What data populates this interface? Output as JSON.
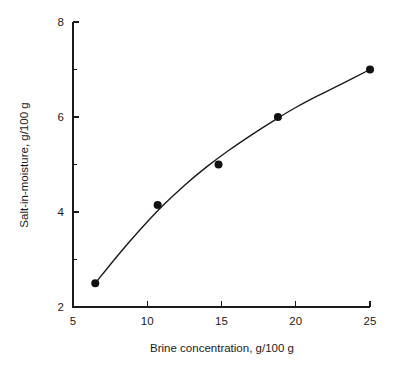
{
  "chart_data": {
    "type": "scatter",
    "title": "",
    "subtitle": "",
    "xlabel": "Brine concentration, g/100 g",
    "ylabel": "Salt-in-moisture, g/100 g",
    "xlim": [
      5,
      25
    ],
    "ylim": [
      2,
      8
    ],
    "xticks": [
      5,
      10,
      15,
      20,
      25
    ],
    "xtick_labels": [
      "5",
      "10",
      "15",
      "20",
      "25"
    ],
    "yticks": [
      2,
      4,
      6,
      8
    ],
    "ytick_labels": [
      "2",
      "4",
      "6",
      "8"
    ],
    "y_minor_ticks": [
      3,
      5,
      7
    ],
    "x_minor_ticks": [],
    "grid": false,
    "legend": null,
    "legend_position": "none",
    "annotations": [],
    "marker_color": "#111111",
    "line_color": "#1a1a1a",
    "axis_color": "#1a1a1a",
    "background_color": "#ffffff",
    "series": [
      {
        "name": "Salt-in-moisture vs brine concentration",
        "marker": "filled-circle",
        "has_fit_curve": true,
        "points": [
          {
            "x": 6.5,
            "y": 2.5
          },
          {
            "x": 10.7,
            "y": 4.15
          },
          {
            "x": 14.8,
            "y": 5.0
          },
          {
            "x": 18.8,
            "y": 6.0
          },
          {
            "x": 25.0,
            "y": 7.0
          }
        ],
        "x": [
          6.5,
          10.7,
          14.8,
          18.8,
          25.0
        ],
        "values": [
          2.5,
          4.15,
          5.0,
          6.0,
          7.0
        ]
      }
    ],
    "fit_curve": {
      "description": "smooth monotonic increasing curve through the points, flattening at high brine concentration",
      "x": [
        6.5,
        8.0,
        9.5,
        11.0,
        12.5,
        14.0,
        15.5,
        17.0,
        18.5,
        20.0,
        21.5,
        23.0,
        25.0
      ],
      "y": [
        2.5,
        3.08,
        3.62,
        4.12,
        4.56,
        4.95,
        5.3,
        5.62,
        5.92,
        6.2,
        6.45,
        6.68,
        7.0
      ]
    }
  }
}
